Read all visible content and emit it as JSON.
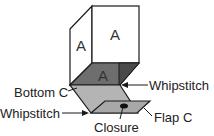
{
  "diagram": {
    "faces": {
      "front": "A",
      "side": "A",
      "bottom": "A"
    },
    "labels": {
      "bottom_c": "Bottom C",
      "whipstitch_right": "Whipstitch",
      "whipstitch_left": "Whipstitch",
      "flap_c": "Flap C",
      "closure": "Closure"
    },
    "colors": {
      "outline": "#1a1a1a",
      "dark_face": "#6e6e6e",
      "darker_face": "#4a4a4a",
      "gray_face": "#b4b4b4",
      "flap_face": "#a8a8a8"
    }
  }
}
